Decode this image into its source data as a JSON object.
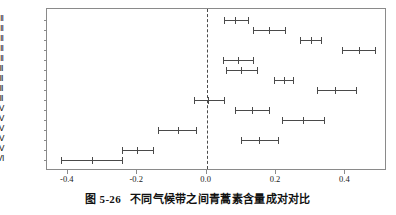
{
  "caption": {
    "number": "图 5-26",
    "text": "不同气候带之间青蒿素含量成对对比"
  },
  "chart_data": {
    "type": "scatter",
    "subtype": "pairwise-difference-confidence-intervals",
    "title": "不同气候带之间青蒿素含量成对对比",
    "xlabel": "",
    "ylabel": "",
    "xlim": [
      -0.46,
      0.52
    ],
    "ylim_categories_order": "top-to-bottom",
    "grid": false,
    "legend": null,
    "reference_line": {
      "value": 0.0,
      "style": "dashed",
      "orientation": "vertical"
    },
    "xticks": [
      "-0.4",
      "-0.2",
      "0.0",
      "0.2",
      "0.4"
    ],
    "xtick_values": [
      -0.4,
      -0.2,
      0.0,
      0.2,
      0.4
    ],
    "categories": [
      "Ⅲ - Ⅱ",
      "Ⅳ - Ⅱ",
      "Ⅴ - Ⅱ",
      "Ⅵ - Ⅱ",
      "H - Ⅱ",
      "Ⅳ - Ⅲ",
      "Ⅴ - Ⅲ",
      "Ⅵ - Ⅲ",
      "H - Ⅲ",
      "Ⅴ - Ⅳ",
      "Ⅵ - Ⅳ",
      "H - Ⅳ",
      "Ⅵ - Ⅴ",
      "H - Ⅴ",
      "H - Ⅵ"
    ],
    "estimates": [
      0.082,
      0.18,
      0.3,
      0.44,
      0.09,
      0.1,
      0.222,
      0.37,
      0.005,
      0.13,
      0.277,
      -0.082,
      0.152,
      -0.2,
      -0.33
    ],
    "lower": [
      0.05,
      0.135,
      0.27,
      0.39,
      0.048,
      0.055,
      0.195,
      0.318,
      -0.035,
      0.082,
      0.218,
      -0.14,
      0.1,
      -0.245,
      -0.42
    ],
    "upper": [
      0.118,
      0.227,
      0.33,
      0.485,
      0.133,
      0.145,
      0.25,
      0.432,
      0.05,
      0.18,
      0.338,
      -0.03,
      0.205,
      -0.155,
      -0.245
    ]
  }
}
